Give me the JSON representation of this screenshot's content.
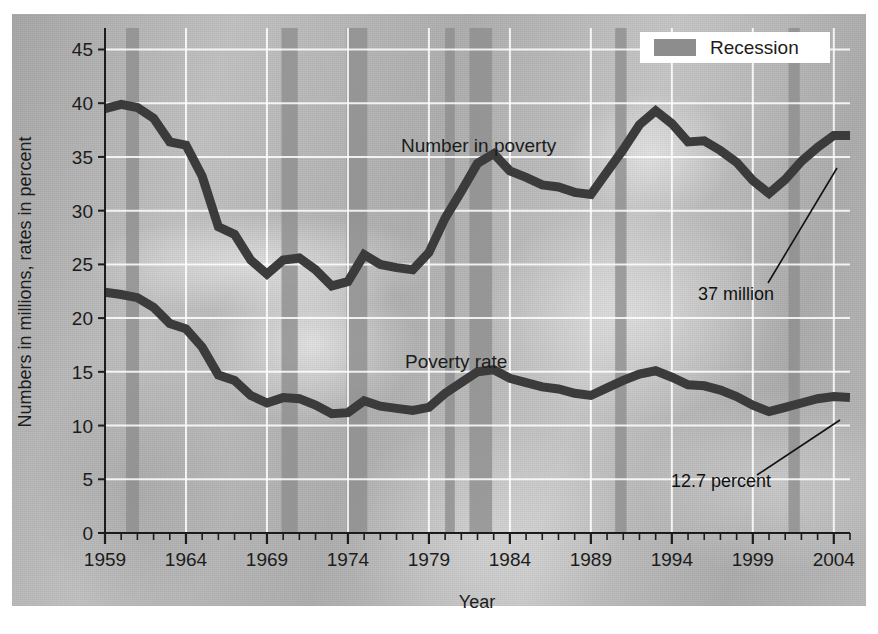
{
  "chart_data": {
    "type": "line",
    "title": "",
    "xlabel": "Year",
    "ylabel": "Numbers in millions, rates in percent",
    "xlim": [
      1959,
      2005
    ],
    "ylim": [
      0,
      47
    ],
    "grid": true,
    "legend_position": "top-right",
    "y_ticks": [
      0,
      5,
      10,
      15,
      20,
      25,
      30,
      35,
      40,
      45
    ],
    "x_ticks_labeled": [
      1959,
      1964,
      1969,
      1974,
      1979,
      1984,
      1989,
      1994,
      1999,
      2004
    ],
    "x_tick_step_minor": 1,
    "series": [
      {
        "name": "Number in poverty",
        "units": "millions",
        "x": [
          1959,
          1960,
          1961,
          1962,
          1963,
          1964,
          1965,
          1966,
          1967,
          1968,
          1969,
          1970,
          1971,
          1972,
          1973,
          1974,
          1975,
          1976,
          1977,
          1978,
          1979,
          1980,
          1981,
          1982,
          1983,
          1984,
          1985,
          1986,
          1987,
          1988,
          1989,
          1990,
          1991,
          1992,
          1993,
          1994,
          1995,
          1996,
          1997,
          1998,
          1999,
          2000,
          2001,
          2002,
          2003,
          2004,
          2005
        ],
        "values": [
          39.5,
          39.9,
          39.6,
          38.6,
          36.4,
          36.1,
          33.2,
          28.5,
          27.8,
          25.4,
          24.1,
          25.4,
          25.6,
          24.5,
          23.0,
          23.4,
          25.9,
          25.0,
          24.7,
          24.5,
          26.1,
          29.3,
          31.8,
          34.4,
          35.3,
          33.7,
          33.1,
          32.4,
          32.2,
          31.7,
          31.5,
          33.6,
          35.7,
          38.0,
          39.3,
          38.1,
          36.4,
          36.5,
          35.6,
          34.5,
          32.8,
          31.6,
          32.9,
          34.6,
          35.9,
          37.0,
          37.0
        ]
      },
      {
        "name": "Poverty rate",
        "units": "percent",
        "x": [
          1959,
          1960,
          1961,
          1962,
          1963,
          1964,
          1965,
          1966,
          1967,
          1968,
          1969,
          1970,
          1971,
          1972,
          1973,
          1974,
          1975,
          1976,
          1977,
          1978,
          1979,
          1980,
          1981,
          1982,
          1983,
          1984,
          1985,
          1986,
          1987,
          1988,
          1989,
          1990,
          1991,
          1992,
          1993,
          1994,
          1995,
          1996,
          1997,
          1998,
          1999,
          2000,
          2001,
          2002,
          2003,
          2004,
          2005
        ],
        "values": [
          22.4,
          22.2,
          21.9,
          21.0,
          19.5,
          19.0,
          17.3,
          14.7,
          14.2,
          12.8,
          12.1,
          12.6,
          12.5,
          11.9,
          11.1,
          11.2,
          12.3,
          11.8,
          11.6,
          11.4,
          11.7,
          13.0,
          14.0,
          15.0,
          15.2,
          14.4,
          14.0,
          13.6,
          13.4,
          13.0,
          12.8,
          13.5,
          14.2,
          14.8,
          15.1,
          14.5,
          13.8,
          13.7,
          13.3,
          12.7,
          11.9,
          11.3,
          11.7,
          12.1,
          12.5,
          12.7,
          12.6
        ]
      }
    ],
    "recessions": [
      {
        "start": 1960.3,
        "end": 1961.1
      },
      {
        "start": 1969.9,
        "end": 1970.9
      },
      {
        "start": 1973.9,
        "end": 1975.2
      },
      {
        "start": 1980.0,
        "end": 1980.6
      },
      {
        "start": 1981.5,
        "end": 1982.9
      },
      {
        "start": 1990.5,
        "end": 1991.2
      },
      {
        "start": 2001.2,
        "end": 2001.9
      }
    ],
    "annotations": [
      {
        "text": "37 million",
        "series": "Number in poverty",
        "value": 37.0,
        "year": 2004
      },
      {
        "text": "12.7 percent",
        "series": "Poverty rate",
        "value": 12.7,
        "year": 2004
      }
    ],
    "series_inline_labels": [
      {
        "text": "Number in poverty"
      },
      {
        "text": "Poverty rate"
      }
    ]
  },
  "legend": {
    "recession_label": "Recession",
    "recession_color": "#8d8d8d"
  },
  "axes": {
    "y_title": "Numbers in millions, rates in percent",
    "x_title": "Year",
    "y_tick_labels": [
      "0",
      "5",
      "10",
      "15",
      "20",
      "25",
      "30",
      "35",
      "40",
      "45"
    ],
    "x_tick_labels": [
      "1959",
      "1964",
      "1969",
      "1974",
      "1979",
      "1984",
      "1989",
      "1994",
      "1999",
      "2004"
    ]
  },
  "labels": {
    "number_in_poverty": "Number in poverty",
    "poverty_rate": "Poverty rate",
    "annot_million": "37 million",
    "annot_percent": "12.7 percent"
  },
  "colors": {
    "series_line": "#3b3b3b",
    "recession_band": "#8d8d8d",
    "gridline": "#ffffff",
    "axis": "#1c1c1c",
    "text": "#1c1c1c",
    "legend_box": "#ffffff",
    "page_background": "#ffffff"
  }
}
